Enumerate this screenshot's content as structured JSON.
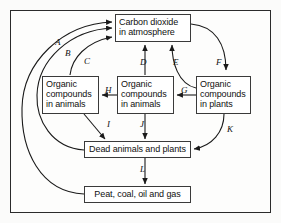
{
  "diagram": {
    "frame": {
      "border_color": "#2b2b2b",
      "background": "#fdfdfc"
    },
    "nodes": [
      {
        "id": "co2",
        "lines": [
          "Carbon dioxide",
          "in atmosphere"
        ]
      },
      {
        "id": "organic_compounds_animals_left",
        "lines": [
          "Organic",
          "compounds",
          "in animals"
        ]
      },
      {
        "id": "organic_compounds_animals_center",
        "lines": [
          "Organic",
          "compounds",
          "in animals"
        ]
      },
      {
        "id": "organic_compounds_plants_right",
        "lines": [
          "Organic",
          "compounds",
          "in plants"
        ]
      },
      {
        "id": "dead",
        "lines": [
          "Dead animals and plants"
        ]
      },
      {
        "id": "fossil",
        "lines": [
          "Peat, coal, oil and gas"
        ]
      }
    ],
    "edges": [
      {
        "label": "A",
        "from": "fossil",
        "to": "co2",
        "style": "curved"
      },
      {
        "label": "B",
        "from": "dead",
        "to": "co2",
        "style": "curved"
      },
      {
        "label": "C",
        "from": "organic_compounds_animals_left",
        "to": "co2",
        "style": "curved"
      },
      {
        "label": "D",
        "from": "organic_compounds_animals_center",
        "to": "co2",
        "style": "straight"
      },
      {
        "label": "E",
        "from": "organic_compounds_plants_right",
        "to": "co2",
        "style": "curved"
      },
      {
        "label": "F",
        "from": "co2",
        "to": "organic_compounds_plants_right",
        "style": "curved"
      },
      {
        "label": "G",
        "from": "organic_compounds_plants_right",
        "to": "organic_compounds_animals_center",
        "style": "straight"
      },
      {
        "label": "H",
        "from": "organic_compounds_animals_center",
        "to": "organic_compounds_animals_left",
        "style": "straight"
      },
      {
        "label": "I",
        "from": "organic_compounds_animals_left",
        "to": "dead",
        "style": "diagonal"
      },
      {
        "label": "J",
        "from": "organic_compounds_animals_center",
        "to": "dead",
        "style": "straight"
      },
      {
        "label": "K",
        "from": "organic_compounds_plants_right",
        "to": "dead",
        "style": "curved"
      },
      {
        "label": "L",
        "from": "dead",
        "to": "fossil",
        "style": "straight"
      }
    ],
    "labels": {
      "A": "A",
      "B": "B",
      "C": "C",
      "D": "D",
      "E": "E",
      "F": "F",
      "G": "G",
      "H": "H",
      "I": "I",
      "J": "J",
      "K": "K",
      "L": "L"
    }
  }
}
